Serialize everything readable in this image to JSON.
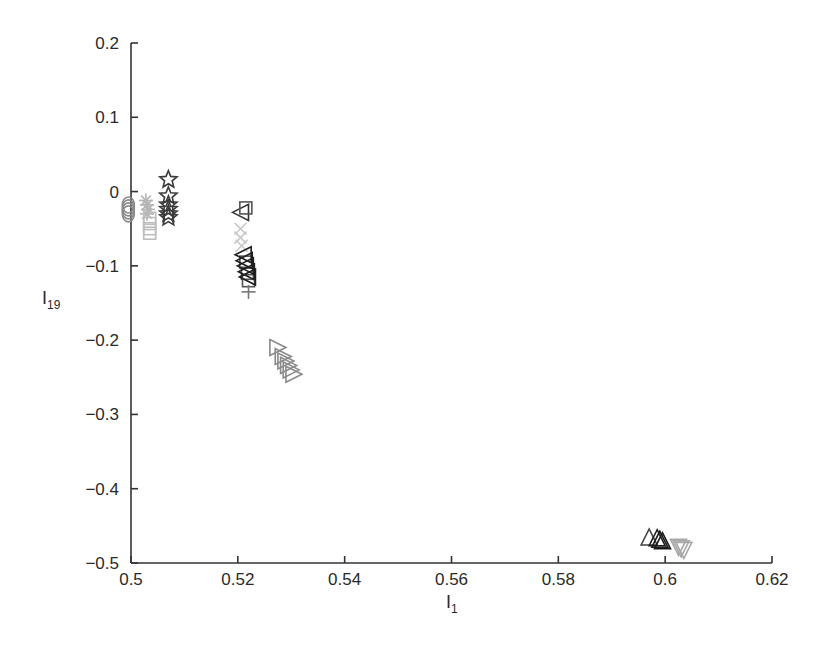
{
  "chart_data": {
    "type": "scatter",
    "title": "",
    "xlabel": "I",
    "xlabel_subscript": "1",
    "ylabel": "I",
    "ylabel_subscript": "19",
    "xlim": [
      0.5,
      0.62
    ],
    "ylim": [
      -0.5,
      0.2
    ],
    "xticks": [
      0.5,
      0.52,
      0.54,
      0.56,
      0.58,
      0.6,
      0.62
    ],
    "xtick_labels": [
      "0.5",
      "0.52",
      "0.54",
      "0.56",
      "0.58",
      "0.6",
      "0.62"
    ],
    "yticks": [
      -0.5,
      -0.4,
      -0.3,
      -0.2,
      -0.1,
      0,
      0.1,
      0.2
    ],
    "ytick_labels": [
      "−0.5",
      "−0.4",
      "−0.3",
      "−0.2",
      "−0.1",
      "0",
      "0.1",
      "0.2"
    ],
    "grid": false,
    "legend": null,
    "series": [
      {
        "name": "circle",
        "marker": "circle",
        "color": "#8a8a8a",
        "x": [
          0.4995,
          0.4995,
          0.4995,
          0.4995
        ],
        "y": [
          -0.018,
          -0.022,
          -0.026,
          -0.03
        ]
      },
      {
        "name": "asterisk",
        "marker": "asterisk",
        "color": "#b5b5b5",
        "x": [
          0.5028,
          0.503,
          0.5032,
          0.503
        ],
        "y": [
          -0.012,
          -0.018,
          -0.024,
          -0.03
        ]
      },
      {
        "name": "square-light",
        "marker": "square",
        "color": "#bdbdbd",
        "x": [
          0.5035,
          0.5035,
          0.5035,
          0.5035
        ],
        "y": [
          -0.036,
          -0.043,
          -0.05,
          -0.056
        ]
      },
      {
        "name": "star",
        "marker": "star",
        "color": "#3a3a3a",
        "x": [
          0.507,
          0.507,
          0.507,
          0.507,
          0.507,
          0.507
        ],
        "y": [
          0.016,
          -0.006,
          -0.018,
          -0.024,
          -0.03,
          -0.035
        ]
      },
      {
        "name": "triangle-left-open",
        "marker": "triangle-left",
        "color": "#333333",
        "x": [
          0.5205
        ],
        "y": [
          -0.028
        ]
      },
      {
        "name": "square-open",
        "marker": "square",
        "color": "#555555",
        "x": [
          0.5215,
          0.5215,
          0.5218,
          0.522
        ],
        "y": [
          -0.022,
          -0.095,
          -0.11,
          -0.12
        ]
      },
      {
        "name": "x-light",
        "marker": "x",
        "color": "#c8c8c8",
        "x": [
          0.5205,
          0.5205,
          0.5207
        ],
        "y": [
          -0.05,
          -0.062,
          -0.073
        ]
      },
      {
        "name": "triangle-left-dark",
        "marker": "triangle-left",
        "color": "#1e1e1e",
        "x": [
          0.521,
          0.5212,
          0.5214,
          0.5216,
          0.5218
        ],
        "y": [
          -0.085,
          -0.093,
          -0.1,
          -0.108,
          -0.115
        ]
      },
      {
        "name": "plus",
        "marker": "plus",
        "color": "#777777",
        "x": [
          0.522
        ],
        "y": [
          -0.135
        ]
      },
      {
        "name": "triangle-right",
        "marker": "triangle-right",
        "color": "#8a8a8a",
        "x": [
          0.5275,
          0.5285,
          0.529,
          0.5295,
          0.53,
          0.5305
        ],
        "y": [
          -0.21,
          -0.222,
          -0.228,
          -0.234,
          -0.24,
          -0.246
        ]
      },
      {
        "name": "triangle-up-open",
        "marker": "triangle-up",
        "color": "#444444",
        "x": [
          0.597
        ],
        "y": [
          -0.465
        ]
      },
      {
        "name": "triangle-up-dark",
        "marker": "triangle-up",
        "color": "#1a1a1a",
        "x": [
          0.5985,
          0.599,
          0.5995
        ],
        "y": [
          -0.466,
          -0.468,
          -0.47
        ]
      },
      {
        "name": "triangle-down",
        "marker": "triangle-down",
        "color": "#a8a8a8",
        "x": [
          0.6025,
          0.603,
          0.6035
        ],
        "y": [
          -0.479,
          -0.481,
          -0.483
        ]
      }
    ]
  }
}
